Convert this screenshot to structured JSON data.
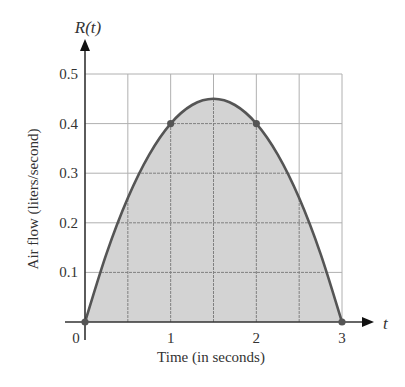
{
  "chart_data": {
    "type": "area",
    "title": "",
    "function_label": "R(t)",
    "xlabel": "Time (in seconds)",
    "ylabel": "Air flow (liters/second)",
    "x_axis_symbol": "t",
    "xlim": [
      0,
      3
    ],
    "ylim": [
      0,
      0.5
    ],
    "x_ticks": [
      0,
      1,
      2,
      3
    ],
    "x_tick_labels": [
      "0",
      "1",
      "2",
      "3"
    ],
    "y_ticks": [
      0.1,
      0.2,
      0.3,
      0.4,
      0.5
    ],
    "y_tick_labels": [
      "0.1",
      "0.2",
      "0.3",
      "0.4",
      "0.5"
    ],
    "grid": true,
    "grid_x_step": 0.5,
    "grid_y_step": 0.1,
    "curve": {
      "description": "Parabolic air-flow curve, shaded region underneath",
      "x": [
        0,
        0.25,
        0.5,
        0.75,
        1,
        1.25,
        1.5,
        1.75,
        2,
        2.25,
        2.5,
        2.75,
        3
      ],
      "y": [
        0,
        0.1375,
        0.25,
        0.3375,
        0.4,
        0.4375,
        0.45,
        0.4375,
        0.4,
        0.3375,
        0.25,
        0.1375,
        0
      ]
    },
    "marked_points": [
      {
        "x": 0,
        "y": 0
      },
      {
        "x": 1,
        "y": 0.4
      },
      {
        "x": 2,
        "y": 0.4
      },
      {
        "x": 3,
        "y": 0
      }
    ],
    "colors": {
      "fill": "#d3d3d3",
      "curve": "#555555",
      "grid_outside": "#b0b0b0",
      "grid_inside": "#808080",
      "axis": "#333333",
      "point": "#555555"
    }
  }
}
